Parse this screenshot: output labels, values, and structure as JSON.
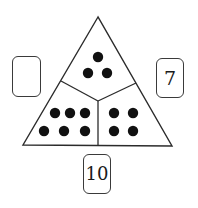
{
  "diagram": {
    "type": "number-bond-triangle",
    "colors": {
      "line": "#2b2b2b",
      "dot": "#111111",
      "background": "#ffffff"
    },
    "triangle": {
      "apex": [
        98,
        17
      ],
      "bottom_left": [
        23,
        145
      ],
      "bottom_right": [
        172,
        146
      ],
      "center": [
        98,
        101
      ],
      "divider_left_end": [
        61,
        81
      ],
      "divider_right_end": [
        136,
        83
      ],
      "divider_bottom_end": [
        98,
        146
      ]
    },
    "sections": [
      {
        "name": "top",
        "dot_count": 3,
        "dots": [
          [
            98,
            57
          ],
          [
            88,
            73
          ],
          [
            107,
            73
          ]
        ]
      },
      {
        "name": "bottom-left",
        "dot_count": 6,
        "dots": [
          [
            55,
            113
          ],
          [
            70,
            113
          ],
          [
            85,
            113
          ],
          [
            44,
            131
          ],
          [
            64,
            131
          ],
          [
            85,
            131
          ]
        ]
      },
      {
        "name": "bottom-right",
        "dot_count": 4,
        "dots": [
          [
            114,
            113
          ],
          [
            133,
            113
          ],
          [
            114,
            131
          ],
          [
            133,
            131
          ]
        ]
      }
    ],
    "dot_radius": 5.2,
    "boxes": {
      "left": {
        "value": ""
      },
      "right": {
        "value": "7"
      },
      "bottom": {
        "value": "10"
      }
    }
  }
}
